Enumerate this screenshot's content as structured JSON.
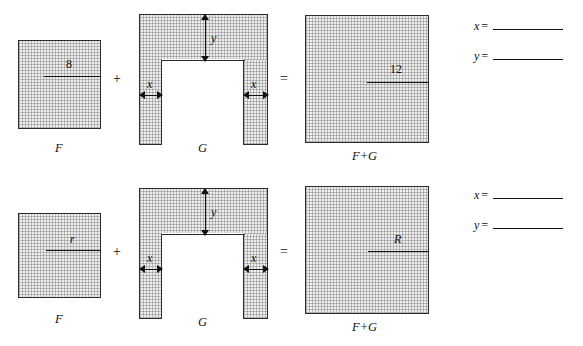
{
  "page": {
    "background": "#ffffff",
    "ink_color": "#111111",
    "fill_color": "#eeeeee"
  },
  "operators": {
    "plus": "+",
    "equals": "="
  },
  "rows": [
    {
      "id": "row-1",
      "figures": {
        "f": {
          "caption": "F",
          "measure_label": "8"
        },
        "g": {
          "caption": "G",
          "height_label": "y",
          "left_width_label": "x",
          "right_width_label": "x"
        },
        "sum": {
          "caption": "F+G",
          "measure_label": "12"
        }
      },
      "answers": [
        {
          "var": "x",
          "eq": "=",
          "value": ""
        },
        {
          "var": "y",
          "eq": "=",
          "value": ""
        }
      ]
    },
    {
      "id": "row-2",
      "figures": {
        "f": {
          "caption": "F",
          "measure_label": "r"
        },
        "g": {
          "caption": "G",
          "height_label": "y",
          "left_width_label": "x",
          "right_width_label": "x"
        },
        "sum": {
          "caption": "F+G",
          "measure_label": "R"
        }
      },
      "answers": [
        {
          "var": "x",
          "eq": "=",
          "value": ""
        },
        {
          "var": "y",
          "eq": "=",
          "value": ""
        }
      ]
    }
  ]
}
